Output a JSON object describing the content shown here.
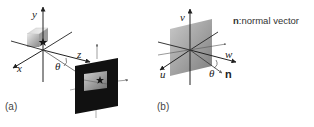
{
  "figure": {
    "panel_a": {
      "caption": "(a)",
      "axes": {
        "x": "x",
        "y": "y",
        "z": "z"
      },
      "angle_label": "θ",
      "objects": [
        "cube with star",
        "black image plane with star"
      ]
    },
    "panel_b": {
      "caption": "(b)",
      "axes": {
        "u": "u",
        "v": "v",
        "w": "w"
      },
      "normal_label": "n",
      "angle_label": "θ"
    },
    "legend": {
      "symbol": "n",
      "text": ":normal vector"
    }
  },
  "colors": {
    "axis": "#222222",
    "plane_dark": "#111111",
    "plane_gray": "#9a9a9a",
    "background": "#ffffff"
  }
}
